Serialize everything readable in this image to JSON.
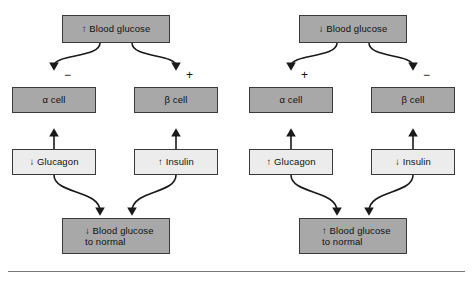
{
  "figure": {
    "colors": {
      "shaded_box": "#a8a8a8",
      "light_box": "#ececec",
      "border": "#3a3a3a",
      "text": "#111111",
      "background": "#ffffff",
      "rule": "#777777"
    }
  },
  "panels": [
    {
      "id": "high-glucose-panel",
      "top": {
        "label": "↑ Blood glucose",
        "fill": "shaded"
      },
      "left_branch_sign": "−",
      "right_branch_sign": "+",
      "alpha": {
        "label": "α cell",
        "fill": "shaded"
      },
      "beta": {
        "label": "β cell",
        "fill": "shaded"
      },
      "glucagon": {
        "label": "↓ Glucagon",
        "fill": "light"
      },
      "insulin": {
        "label": "↑ Insulin",
        "fill": "light"
      },
      "bottom": {
        "line1": "↓ Blood glucose",
        "line2": "to normal",
        "fill": "shaded"
      }
    },
    {
      "id": "low-glucose-panel",
      "top": {
        "label": "↓ Blood glucose",
        "fill": "shaded"
      },
      "left_branch_sign": "+",
      "right_branch_sign": "−",
      "alpha": {
        "label": "α cell",
        "fill": "shaded"
      },
      "beta": {
        "label": "β cell",
        "fill": "shaded"
      },
      "glucagon": {
        "label": "↑ Glucagon",
        "fill": "light"
      },
      "insulin": {
        "label": "↓ Insulin",
        "fill": "light"
      },
      "bottom": {
        "line1": "↑ Blood glucose",
        "line2": "to normal",
        "fill": "shaded"
      }
    }
  ]
}
